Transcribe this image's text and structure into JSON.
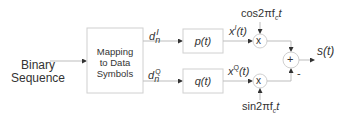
{
  "input_label_line1": "Binary",
  "input_label_line2": "Sequence",
  "mapper": {
    "line1": "Mapping",
    "line2": "to Data",
    "line3": "Symbols"
  },
  "branch_i": {
    "symbol": "d",
    "sub": "n",
    "sup": "I",
    "filter": "p(t)",
    "output": "x",
    "output_sup": "I",
    "output_arg": "(t)",
    "carrier": "cos2πf",
    "carrier_sub": "c",
    "carrier_t": "t"
  },
  "branch_q": {
    "symbol": "d",
    "sub": "n",
    "sup": "Q",
    "filter": "q(t)",
    "output": "x",
    "output_sup": "Q",
    "output_arg": "(t)",
    "carrier": "sin2πf",
    "carrier_sub": "c",
    "carrier_t": "t"
  },
  "multiplier_symbol": "x",
  "adder_symbol": "+",
  "adder_minus": "-",
  "output_label": "s(t)",
  "colors": {
    "line": "#bdbdbd",
    "arrow": "#333333",
    "text": "#333333",
    "box": "#d0d0d0"
  }
}
